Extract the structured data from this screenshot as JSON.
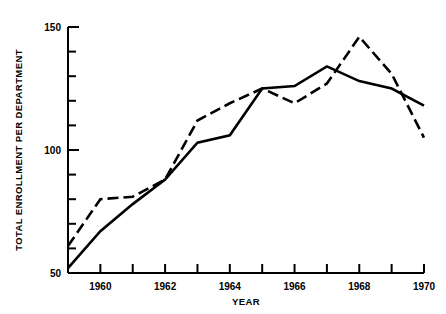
{
  "chart_data": {
    "type": "line",
    "title": "",
    "xlabel": "YEAR",
    "ylabel": "TOTAL ENROLLMENT PER DEPARTMENT",
    "xlim": [
      1959,
      1970
    ],
    "ylim": [
      50,
      150
    ],
    "grid": false,
    "legend": "none",
    "x_ticks_major": [
      1960,
      1962,
      1964,
      1966,
      1968,
      1970
    ],
    "x_ticks_all": [
      1959,
      1960,
      1961,
      1962,
      1963,
      1964,
      1965,
      1966,
      1967,
      1968,
      1969,
      1970
    ],
    "x_tick_labels": [
      "1960",
      "1962",
      "1964",
      "1966",
      "1968",
      "1970"
    ],
    "y_ticks_major": [
      50,
      100,
      150
    ],
    "y_ticks_minor": [
      60,
      70,
      80,
      90,
      110,
      120,
      130,
      140
    ],
    "y_tick_labels": [
      "50",
      "100",
      "150"
    ],
    "x": [
      1959,
      1960,
      1961,
      1962,
      1963,
      1964,
      1965,
      1966,
      1967,
      1968,
      1969,
      1970
    ],
    "series": [
      {
        "name": "solid-series",
        "style": "solid",
        "color": "#000000",
        "values": [
          52,
          67,
          78,
          88,
          103,
          106,
          125,
          126,
          134,
          128,
          125,
          118
        ]
      },
      {
        "name": "dashed-series",
        "style": "dashed",
        "color": "#000000",
        "values": [
          61,
          80,
          81,
          88,
          112,
          119,
          125,
          119,
          127,
          146,
          131,
          105
        ]
      }
    ]
  }
}
